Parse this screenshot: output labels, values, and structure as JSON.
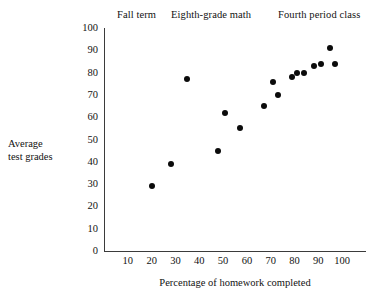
{
  "header": {
    "items": [
      {
        "label": "Fall term"
      },
      {
        "label": "Eighth-grade math"
      },
      {
        "label": "Fourth period class"
      }
    ]
  },
  "chart_data": {
    "type": "scatter",
    "title": "Fall term   Eighth-grade math   Fourth period class",
    "xlabel": "Percentage of homework completed",
    "ylabel": "Average test grades",
    "ylabel_lines": [
      "Average",
      "test grades"
    ],
    "xlim": [
      0,
      110
    ],
    "ylim": [
      0,
      100
    ],
    "xticks": [
      10,
      20,
      30,
      40,
      50,
      60,
      70,
      80,
      90,
      100
    ],
    "yticks": [
      0,
      10,
      20,
      30,
      40,
      50,
      60,
      70,
      80,
      90,
      100
    ],
    "xtick_labels": [
      "10",
      "20",
      "30",
      "40",
      "50",
      "60",
      "70",
      "80",
      "90",
      "100"
    ],
    "ytick_labels": [
      "0",
      "10",
      "20",
      "30",
      "40",
      "50",
      "60",
      "70",
      "80",
      "90",
      "100"
    ],
    "grid": false,
    "legend": null,
    "marker_color": "#0b0b0b",
    "axis_color": "#3b3b3b",
    "points": [
      {
        "x": 20,
        "y": 29
      },
      {
        "x": 28,
        "y": 39
      },
      {
        "x": 35,
        "y": 77
      },
      {
        "x": 48,
        "y": 45
      },
      {
        "x": 51,
        "y": 62
      },
      {
        "x": 57,
        "y": 55
      },
      {
        "x": 67,
        "y": 65
      },
      {
        "x": 71,
        "y": 76
      },
      {
        "x": 73,
        "y": 70
      },
      {
        "x": 79,
        "y": 78
      },
      {
        "x": 81,
        "y": 80
      },
      {
        "x": 84,
        "y": 80
      },
      {
        "x": 88,
        "y": 83
      },
      {
        "x": 91,
        "y": 84
      },
      {
        "x": 95,
        "y": 91
      },
      {
        "x": 97,
        "y": 84
      }
    ]
  }
}
